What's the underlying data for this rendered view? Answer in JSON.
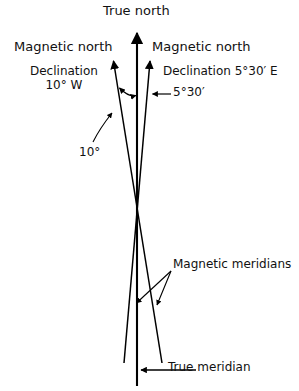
{
  "figure": {
    "type": "diagram",
    "background_color": "#ffffff",
    "line_color": "#000000",
    "width": 299,
    "height": 391
  },
  "labels": {
    "true_north": "True north",
    "magnetic_north_left": "Magnetic north",
    "magnetic_north_right": "Magnetic north",
    "declination_west_line1": "Declination",
    "declination_west_line2": "10° W",
    "declination_east": "Declination 5°30′ E",
    "angle_east": "5°30′",
    "angle_west": "10°",
    "magnetic_meridians": "Magnetic meridians",
    "true_meridian": "True meridian"
  },
  "values": {
    "west_declination_degrees": 10,
    "west_declination_direction": "W",
    "east_declination_degrees": 5.5,
    "east_declination_text": "5°30′",
    "east_declination_direction": "E"
  },
  "geometry": {
    "true_meridian": {
      "x1": 137,
      "y1": 31,
      "x2": 137,
      "y2": 386
    },
    "true_north_arrow_tip": {
      "x": 137,
      "y": 31
    },
    "convergence_point": {
      "x": 137,
      "y": 237
    },
    "magnetic_meridian_west": {
      "top_x": 113,
      "top_y": 58,
      "bottom_x": 162,
      "bottom_y": 363
    },
    "magnetic_meridian_east": {
      "top_x": 150,
      "top_y": 58,
      "bottom_x": 124,
      "bottom_y": 363
    },
    "angle_arc_y": 95
  }
}
